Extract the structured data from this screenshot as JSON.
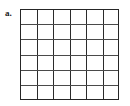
{
  "figure": {
    "label": "a.",
    "type": "square-grid",
    "columns": 6,
    "rows": 6,
    "total_cells": 36,
    "shaded_cells": 0,
    "line_color": "#2b2b2b",
    "background_color": "#ffffff",
    "label_color": "#1a1a1a",
    "grid": {
      "left": 20,
      "top": 9,
      "width": 99,
      "height": 91,
      "cell_width": 16.5,
      "cell_height": 15.1667
    }
  }
}
